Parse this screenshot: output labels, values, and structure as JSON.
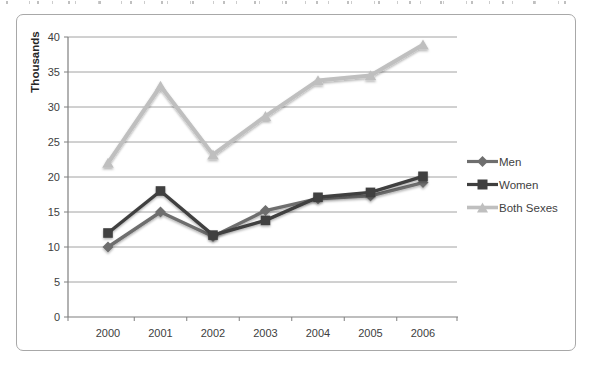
{
  "chart_data": {
    "type": "line",
    "title": "",
    "xlabel": "",
    "ylabel": "Thousands",
    "ylim": [
      0,
      40
    ],
    "ytick_interval": 5,
    "yticks": [
      0,
      5,
      10,
      15,
      20,
      25,
      30,
      35,
      40
    ],
    "categories": [
      "2000",
      "2001",
      "2002",
      "2003",
      "2004",
      "2005",
      "2006"
    ],
    "series": [
      {
        "name": "Men",
        "marker": "diamond",
        "color": "#6e6e6e",
        "values": [
          10,
          15,
          11.5,
          15.2,
          16.9,
          17.3,
          19.2
        ]
      },
      {
        "name": "Women",
        "marker": "square",
        "color": "#3f3f3f",
        "values": [
          12,
          18,
          11.7,
          13.8,
          17.1,
          17.8,
          20.1
        ]
      },
      {
        "name": "Both Sexes",
        "marker": "triangle",
        "color": "#bfbfbf",
        "values": [
          22,
          33,
          23.2,
          28.7,
          33.8,
          34.5,
          38.9
        ]
      }
    ],
    "legend_position": "right",
    "grid": "horizontal",
    "axis_color": "#7f7f7f",
    "gridline_color": "#8c8c8c",
    "tick_label_color": "#404040",
    "frame_border_color": "#a8a8a8",
    "background_color": "#ffffff"
  }
}
